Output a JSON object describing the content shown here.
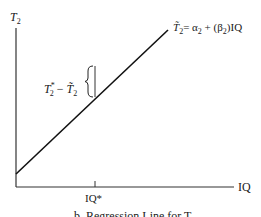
{
  "diagram": {
    "y_axis_label": "T",
    "y_axis_label_sub": "2",
    "x_axis_label": "IQ",
    "x_tick_label": "IQ*",
    "line_equation": {
      "lhs": "T̃",
      "lhs_sub": "2",
      "rhs_prefix": "= α",
      "rhs_alpha_sub": "2",
      "rhs_mid": " + (β",
      "rhs_beta_sub": "2",
      "rhs_suffix": ")IQ"
    },
    "gap_label": {
      "a": "T",
      "a_sub": "2",
      "a_sup": "*",
      "minus": " − ",
      "b": "T̃",
      "b_sub": "2"
    },
    "caption": "b. Regression Line for T₂"
  }
}
